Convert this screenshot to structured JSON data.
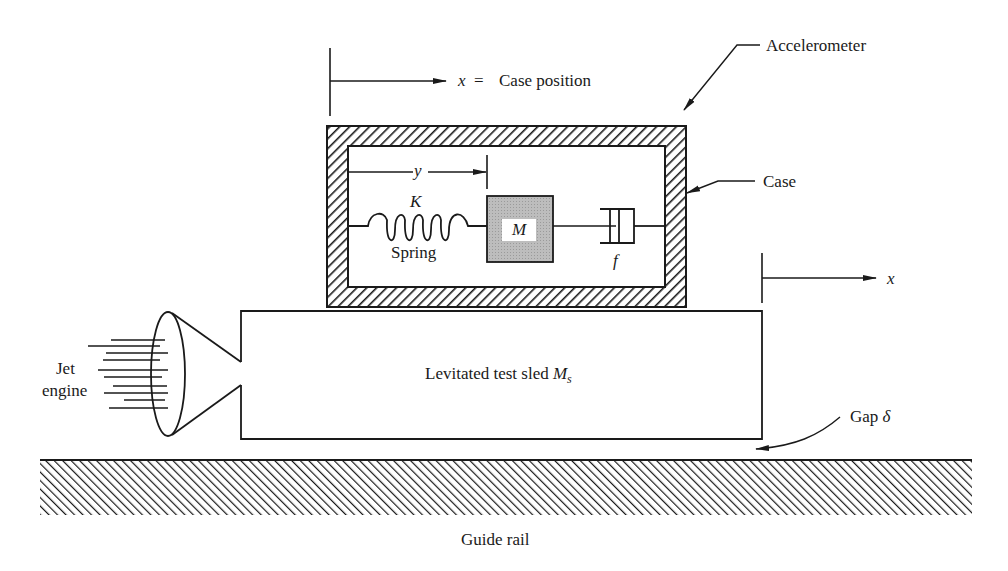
{
  "figure": {
    "labels": {
      "accelerometer": "Accelerometer",
      "case": "Case",
      "case_position_var": "x",
      "case_position_eq": "=",
      "case_position_text": "Case position",
      "y_var": "y",
      "spring_const": "K",
      "spring_name": "Spring",
      "mass": "M",
      "damper": "f",
      "x_var": "x",
      "jet_engine_line1": "Jet",
      "jet_engine_line2": "engine",
      "sled_text": "Levitated test sled",
      "sled_mass": "M",
      "sled_mass_sub": "s",
      "gap_text": "Gap",
      "gap_symbol": "δ",
      "guide_rail": "Guide rail"
    },
    "colors": {
      "line": "#1a1a1a",
      "mass_fill": "#b8b8b8",
      "background": "#ffffff"
    },
    "components": [
      {
        "name": "case",
        "type": "hatched-rectangle"
      },
      {
        "name": "mass",
        "type": "filled-square"
      },
      {
        "name": "spring",
        "type": "coil"
      },
      {
        "name": "damper",
        "type": "dashpot"
      },
      {
        "name": "sled",
        "type": "rectangle"
      },
      {
        "name": "jet-engine",
        "type": "nozzle"
      },
      {
        "name": "guide-rail",
        "type": "hatched-ground"
      }
    ]
  }
}
